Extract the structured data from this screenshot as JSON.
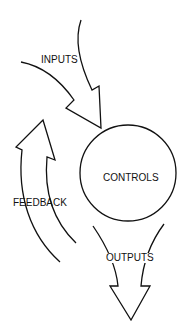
{
  "diagram": {
    "nodes": [
      {
        "id": "controls",
        "label": "CONTROLS",
        "shape": "circle"
      }
    ],
    "arrows": [
      {
        "id": "inputs",
        "label": "INPUTS",
        "direction": "into controls"
      },
      {
        "id": "feedback",
        "label": "FEEDBACK",
        "direction": "looping back upward to inputs"
      },
      {
        "id": "outputs",
        "label": "OUTPUTS",
        "direction": "out of controls downward"
      }
    ],
    "colors": {
      "stroke": "#111111",
      "background": "#ffffff"
    }
  }
}
